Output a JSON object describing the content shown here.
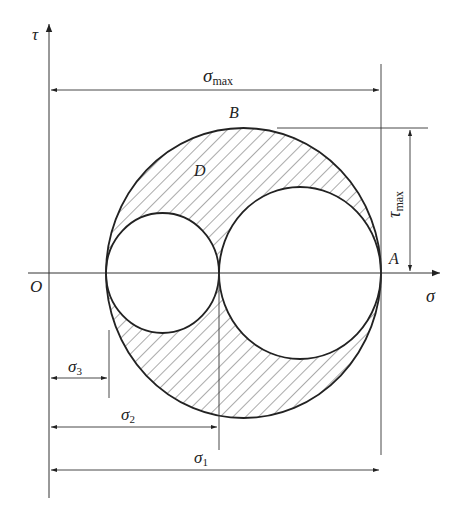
{
  "diagram": {
    "axes": {
      "vertical_label": "τ",
      "horizontal_label": "σ",
      "origin_label": "O"
    },
    "points": {
      "B": "B",
      "D": "D",
      "A": "A"
    },
    "dimensions": {
      "sigma_max": {
        "symbol": "σ",
        "subscript": "max"
      },
      "tau_max": {
        "symbol": "τ",
        "subscript": "max"
      },
      "sigma_1": {
        "symbol": "σ",
        "subscript": "1"
      },
      "sigma_2": {
        "symbol": "σ",
        "subscript": "2"
      },
      "sigma_3": {
        "symbol": "σ",
        "subscript": "3"
      }
    },
    "circles": [
      {
        "name": "outer-circle",
        "from": "σ3",
        "to": "σ1"
      },
      {
        "name": "small-circle",
        "from": "σ3",
        "to": "σ2"
      },
      {
        "name": "middle-circle",
        "from": "σ2",
        "to": "σ1"
      }
    ],
    "colors": {
      "line": "#222222",
      "hatch": "#444444",
      "background": "#ffffff"
    }
  }
}
